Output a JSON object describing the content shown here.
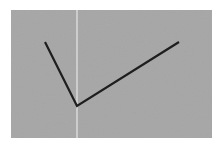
{
  "diagram": {
    "background_color": "#ffffff",
    "panel": {
      "x": 11,
      "y": 10,
      "width": 201,
      "height": 128,
      "fill": "#a9a9a9"
    },
    "vertical_line": {
      "x": 77,
      "y1": 10,
      "y2": 138,
      "color": "#f2f2f2"
    },
    "polyline": {
      "points": [
        [
          45,
          42
        ],
        [
          77,
          106
        ],
        [
          179,
          42
        ]
      ],
      "color": "#1e1e1e",
      "stroke_width": 2.2
    }
  }
}
